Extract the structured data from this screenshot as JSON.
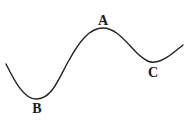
{
  "diagram": {
    "type": "curve-with-labeled-extrema",
    "stroke_color": "#222222",
    "background": "#ffffff",
    "points": [
      {
        "label": "A",
        "kind": "maximum",
        "x": 103,
        "y": 28,
        "label_x": 103,
        "label_y": 21
      },
      {
        "label": "B",
        "kind": "minimum",
        "x": 37,
        "y": 99,
        "label_x": 37,
        "label_y": 113
      },
      {
        "label": "C",
        "kind": "minimum",
        "x": 155,
        "y": 62,
        "label_x": 153,
        "label_y": 77
      }
    ]
  }
}
